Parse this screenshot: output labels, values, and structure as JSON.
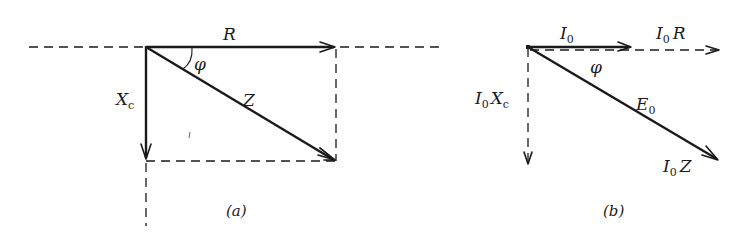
{
  "figure": {
    "panel_a": {
      "caption": "(a)",
      "vectors": {
        "R": {
          "label": "R",
          "style": "solid"
        },
        "Xc": {
          "label": "X",
          "sub": "c",
          "style": "solid"
        },
        "Z": {
          "label": "Z",
          "style": "solid"
        }
      },
      "angle_label": "φ"
    },
    "panel_b": {
      "caption": "(b)",
      "vectors": {
        "I0": {
          "label": "I",
          "sub": "0",
          "style": "solid"
        },
        "I0R": {
          "label_pre": "I",
          "sub": "0",
          "label_post": "R",
          "style": "dashed"
        },
        "I0Xc": {
          "label_pre": "I",
          "sub": "0",
          "label_post": "X",
          "sub2": "c",
          "style": "dashed"
        },
        "E0": {
          "label": "E",
          "sub": "0",
          "style": "solid"
        },
        "I0Z": {
          "label_pre": "I",
          "sub": "0",
          "label_post": "Z"
        }
      },
      "angle_label": "φ"
    }
  }
}
